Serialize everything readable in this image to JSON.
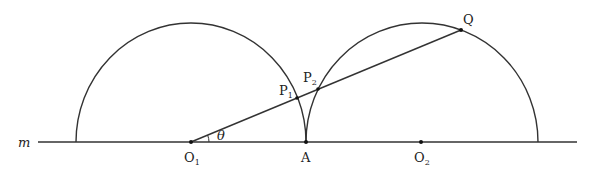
{
  "diagram": {
    "line_label": "m",
    "points": {
      "O1": {
        "label": "O",
        "sub": "1",
        "x": 191,
        "y": 142
      },
      "O2": {
        "label": "O",
        "sub": "2",
        "x": 421,
        "y": 142
      },
      "A": {
        "label": "A",
        "x": 306,
        "y": 142
      },
      "P1": {
        "label": "P",
        "sub": "1",
        "x": 297,
        "y": 98
      },
      "P2": {
        "label": "P",
        "sub": "2",
        "x": 318,
        "y": 89
      },
      "Q": {
        "label": "Q",
        "x": 461,
        "y": 30
      }
    },
    "angle_label": "θ",
    "colors": {
      "stroke": "#333333",
      "background": "#ffffff"
    }
  }
}
